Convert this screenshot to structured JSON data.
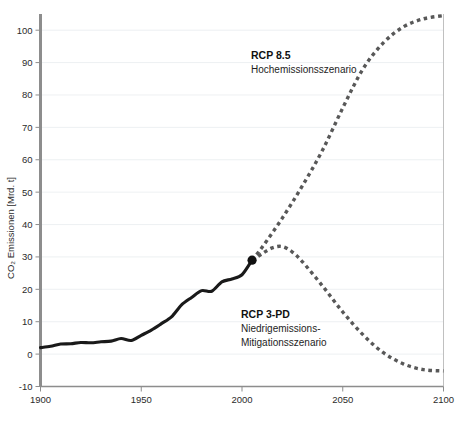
{
  "chart_data": {
    "type": "line",
    "title": "",
    "xlabel": "",
    "ylabel": "CO₂ Emissionen [Mrd. t]",
    "xlim": [
      1900,
      2100
    ],
    "ylim": [
      -10,
      105
    ],
    "xticks": [
      1900,
      1950,
      2000,
      2050,
      2100
    ],
    "yticks": [
      -10,
      0,
      10,
      20,
      30,
      40,
      50,
      60,
      70,
      80,
      90,
      100
    ],
    "grid": true,
    "legend": "annotations-inline",
    "series": [
      {
        "name": "Historisch",
        "style": "solid",
        "color": "#1a1a1a",
        "x": [
          1900,
          1905,
          1910,
          1915,
          1920,
          1925,
          1930,
          1935,
          1940,
          1945,
          1950,
          1955,
          1960,
          1965,
          1970,
          1975,
          1980,
          1985,
          1990,
          1995,
          2000,
          2005
        ],
        "values": [
          2.0,
          2.4,
          3.1,
          3.2,
          3.6,
          3.5,
          3.8,
          4.0,
          4.8,
          4.2,
          5.8,
          7.4,
          9.4,
          11.5,
          15.2,
          17.5,
          19.6,
          19.4,
          22.3,
          23.2,
          24.5,
          29.0
        ]
      },
      {
        "name": "RCP 8.5",
        "style": "dashed",
        "color": "#585858",
        "x": [
          2005,
          2010,
          2020,
          2030,
          2040,
          2050,
          2060,
          2070,
          2080,
          2090,
          2100
        ],
        "values": [
          29.0,
          33.0,
          42.0,
          52.0,
          63.0,
          76.0,
          88.0,
          96.0,
          101.0,
          103.5,
          104.5
        ]
      },
      {
        "name": "RCP 3-PD",
        "style": "dashed",
        "color": "#585858",
        "x": [
          2005,
          2010,
          2015,
          2020,
          2025,
          2030,
          2040,
          2050,
          2060,
          2070,
          2080,
          2090,
          2100
        ],
        "values": [
          29.0,
          31.0,
          32.8,
          33.2,
          31.5,
          28.5,
          21.0,
          13.0,
          6.0,
          0.5,
          -3.0,
          -4.8,
          -5.2
        ]
      }
    ],
    "markers": [
      {
        "name": "historical-projection-junction",
        "x": 2005,
        "y": 29.0
      }
    ]
  },
  "annotations": {
    "rcp85": {
      "title": "RCP 8.5",
      "subtitle": "Hochemissionsszenario"
    },
    "rcp3pd": {
      "title": "RCP 3-PD",
      "subtitle_line1": "Niedrigemissions-",
      "subtitle_line2": "Mitigationsszenario"
    }
  },
  "axes": {
    "y_title": "CO₂ Emissionen [Mrd. t]",
    "y_tick_labels": [
      "100",
      "90",
      "80",
      "70",
      "60",
      "50",
      "40",
      "30",
      "20",
      "10",
      "0",
      "-10"
    ],
    "x_tick_labels": [
      "1900",
      "1950",
      "2000",
      "2050",
      "2100"
    ]
  },
  "colors": {
    "historical": "#1a1a1a",
    "projection": "#585858",
    "grid": "#e9ecef",
    "axis": "#8d8d8d",
    "text": "#2b2b2b"
  }
}
